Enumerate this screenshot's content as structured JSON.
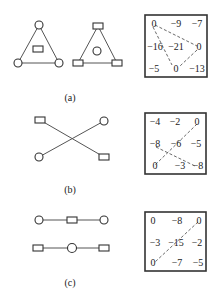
{
  "panels": [
    {
      "label": "(a)",
      "matrix": [
        [
          "0",
          "−9",
          "−7"
        ],
        [
          "−16",
          "−21",
          "0"
        ],
        [
          "−5",
          "0",
          "−13"
        ]
      ],
      "graphs": [
        "triangle with circle vertices and rectangle center",
        "triangle with rectangle vertices and circle center"
      ]
    },
    {
      "label": "(b)",
      "matrix": [
        [
          "−4",
          "−2",
          "0"
        ],
        [
          "−8",
          "−6",
          "−5"
        ],
        [
          "0",
          "−3",
          "−8"
        ]
      ],
      "graphs": [
        "crossing pair: rectangle-to-rectangle and circle-to-circle"
      ]
    },
    {
      "label": "(c)",
      "matrix": [
        [
          "0",
          "−8",
          "0"
        ],
        [
          "−3",
          "−15",
          "−2"
        ],
        [
          "0",
          "−7",
          "−5"
        ]
      ],
      "graphs": [
        "chain circle-rect-circle",
        "chain rect-circle-rect"
      ]
    }
  ]
}
